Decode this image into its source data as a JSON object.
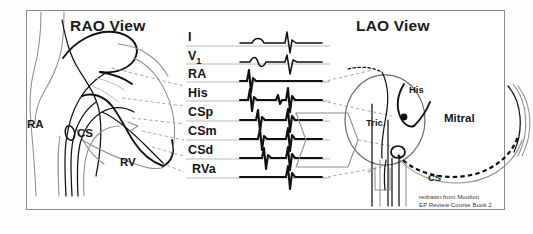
{
  "figure": {
    "kind": "cardiac-electrophysiology-catheter-placement-diagram",
    "frame": {
      "border_color": "#8a8a8a",
      "background": "#ffffff"
    },
    "ink_color": "#111111",
    "faint_ink_color": "#7d7d7d",
    "leader_color": "#9a9a9a"
  },
  "panels": {
    "left": {
      "title": "RAO View"
    },
    "right": {
      "title": "LAO View"
    }
  },
  "rao_labels": [
    {
      "name": "rao-label-ra",
      "text": "RA"
    },
    {
      "name": "rao-label-cs",
      "text": "CS"
    },
    {
      "name": "rao-label-rv",
      "text": "RV"
    }
  ],
  "lao_labels": [
    {
      "name": "lao-label-his",
      "text": "His"
    },
    {
      "name": "lao-label-tric",
      "text": "Tric."
    },
    {
      "name": "lao-label-mitral",
      "text": "Mitral"
    },
    {
      "name": "lao-label-cs",
      "text": "CS"
    }
  ],
  "channels": [
    {
      "key": "I",
      "label": "I",
      "sub": "",
      "type": "surface-ecg"
    },
    {
      "key": "V1",
      "label": "V",
      "sub": "1",
      "type": "surface-ecg"
    },
    {
      "key": "RA",
      "label": "RA",
      "sub": "",
      "type": "intracardiac"
    },
    {
      "key": "His",
      "label": "His",
      "sub": "",
      "type": "intracardiac"
    },
    {
      "key": "CSp",
      "label": "CSp",
      "sub": "",
      "type": "intracardiac"
    },
    {
      "key": "CSm",
      "label": "CSm",
      "sub": "",
      "type": "intracardiac"
    },
    {
      "key": "CSd",
      "label": "CSd",
      "sub": "",
      "type": "intracardiac"
    },
    {
      "key": "RVa",
      "label": "RVa",
      "sub": "",
      "type": "intracardiac"
    }
  ],
  "credit": {
    "line1": "redrawn from Moulton",
    "line2": "EP Review Course Book 2"
  }
}
